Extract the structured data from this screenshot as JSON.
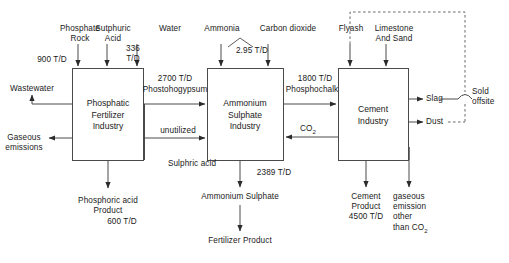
{
  "diagram": {
    "type": "process-flow",
    "units": "T/D",
    "line_color": "#3a3a3a",
    "text_color": "#1a1a1a",
    "background": "#ffffff"
  },
  "boxes": [
    {
      "id": "phosphatic",
      "label": "Phosphatic\nFertilizer\nIndustry"
    },
    {
      "id": "ammonium",
      "label": "Ammonium\nSulphate\nIndustry"
    },
    {
      "id": "cement",
      "label": "Cement\nIndustry"
    }
  ],
  "inputs": {
    "phosphate_rock": "Phosphate\nRock",
    "phosphate_rock_rate": "900 T/D",
    "sulphuric_acid": "Sutphuric\nAcid",
    "sulphuric_acid_rate": "336\nT/D",
    "water": "Water",
    "ammonia": "Ammonia",
    "carbon_dioxide": "Carbon dioxide",
    "ammonia_rate": "2.95 T/D",
    "flyash": "Flyash",
    "limestone_and_sand": "Limestone\nAnd Sand"
  },
  "flows": {
    "phostohogypsum_rate": "2700 T/D",
    "phostohogypsum": "Phostohogypsum",
    "unutilized": "unutilized",
    "sulphric_acid": "Sulphric acid",
    "phosphochalk_rate": "1800 T/D",
    "phosphochalk": "Phosphochalk",
    "co2": "CO",
    "co2_sub": "2"
  },
  "outputs": {
    "wastewater": "Wastewater",
    "gaseous_emissions": "Gaseous\nemissions",
    "phosphoric_acid_product": "Phosphoric acid\nProduct",
    "phosphoric_acid_rate": "600 T/D",
    "ammonium_sulphate_rate": "2389 T/D",
    "ammonium_sulphate": "Ammonium Sulphate",
    "fertilizer_product": "Fertilizer Product",
    "slag": "Slag",
    "dust": "Dust",
    "sold_offsite": "Sold\noffsite",
    "cement_product": "Cement\nProduct\n4500 T/D",
    "gaseous_emission_other": "gaseous\nemission\nother\nthan CO",
    "gaseous_emission_other_sub": "2"
  }
}
